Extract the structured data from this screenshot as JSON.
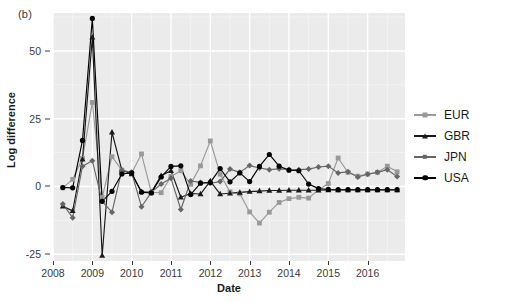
{
  "figure": {
    "panel_tag": "(b)",
    "xlabel": "Date",
    "ylabel": "Log difference"
  },
  "colors": {
    "panel_background": "#ebebeb",
    "grid_major": "#ffffff",
    "grid_minor": "#f5f5f5",
    "EUR": "#999999",
    "GBR": "#1a1a1a",
    "JPN": "#666666",
    "USA": "#000000",
    "axis_text": "#3a3a3a"
  },
  "legend": {
    "items": [
      {
        "label": "EUR",
        "symbol": "square",
        "color": "#999999"
      },
      {
        "label": "GBR",
        "symbol": "triangle",
        "color": "#1a1a1a"
      },
      {
        "label": "JPN",
        "symbol": "diamond",
        "color": "#666666"
      },
      {
        "label": "USA",
        "symbol": "circle",
        "color": "#000000"
      }
    ]
  },
  "chart_data": {
    "type": "line",
    "title": "",
    "subtitle": "",
    "xlabel": "Date",
    "ylabel": "Log difference",
    "xlim": [
      2008.0,
      2016.95
    ],
    "ylim": [
      -27.5,
      64.0
    ],
    "grid": true,
    "legend_position": "right",
    "xticks": [
      2008,
      2009,
      2010,
      2011,
      2012,
      2013,
      2014,
      2015,
      2016
    ],
    "xticklabels": [
      "2008",
      "2009",
      "2010",
      "2011",
      "2012",
      "2013",
      "2014",
      "2015",
      "2016"
    ],
    "yticks": [
      -25,
      0,
      25,
      50
    ],
    "yticklabels": [
      "-25",
      "0",
      "25",
      "50"
    ],
    "x": [
      2008.25,
      2008.5,
      2008.75,
      2009.0,
      2009.25,
      2009.5,
      2009.75,
      2010.0,
      2010.25,
      2010.5,
      2010.75,
      2011.0,
      2011.25,
      2011.5,
      2011.75,
      2012.0,
      2012.25,
      2012.5,
      2012.75,
      2013.0,
      2013.25,
      2013.5,
      2013.75,
      2014.0,
      2014.25,
      2014.5,
      2014.75,
      2015.0,
      2015.25,
      2015.5,
      2015.75,
      2016.0,
      2016.25,
      2016.5,
      2016.75
    ],
    "series": [
      {
        "name": "EUR",
        "color": "#999999",
        "symbol": "square",
        "values": [
          -0.5,
          2.6,
          10.4,
          31.0,
          -4.0,
          11.0,
          6.0,
          5.0,
          12.0,
          -2.2,
          -2.3,
          3.7,
          5.8,
          0.8,
          7.6,
          16.8,
          4.5,
          -2.0,
          -2.7,
          -9.4,
          -13.5,
          -9.5,
          -5.9,
          -4.5,
          -4.0,
          -4.3,
          -1.2,
          1.1,
          10.5,
          5.2,
          3.8,
          4.6,
          5.2,
          7.5,
          5.4
        ]
      },
      {
        "name": "GBR",
        "color": "#1a1a1a",
        "symbol": "triangle",
        "values": [
          -7.3,
          -9.0,
          10.0,
          55.0,
          -25.5,
          20.0,
          6.0,
          4.6,
          -2.0,
          -2.1,
          4.0,
          5.8,
          -4.0,
          -2.6,
          -2.8,
          2.0,
          -2.8,
          -2.5,
          -2.2,
          -1.9,
          -1.7,
          -1.5,
          -1.5,
          -1.4,
          -1.4,
          -1.4,
          -1.4,
          -1.3,
          -1.3,
          -1.3,
          -1.3,
          -1.3,
          -1.3,
          -1.3,
          -1.3
        ]
      },
      {
        "name": "JPN",
        "color": "#666666",
        "symbol": "diamond",
        "values": [
          -6.5,
          -11.5,
          7.5,
          9.5,
          -5.5,
          -9.5,
          6.0,
          5.2,
          -7.5,
          -2.2,
          0.9,
          3.0,
          -8.5,
          2.0,
          1.5,
          1.2,
          1.8,
          6.4,
          5.2,
          7.7,
          6.8,
          6.2,
          6.5,
          6.3,
          6.2,
          6.4,
          7.2,
          7.5,
          5.0,
          5.4,
          3.5,
          4.5,
          5.2,
          6.2,
          3.7
        ]
      },
      {
        "name": "USA",
        "color": "#000000",
        "symbol": "circle",
        "values": [
          -0.4,
          -0.5,
          17.0,
          62.0,
          -5.5,
          -1.8,
          4.6,
          5.0,
          -2.1,
          -2.4,
          3.5,
          7.4,
          7.6,
          -3.0,
          1.2,
          1.5,
          6.6,
          1.7,
          5.0,
          1.8,
          7.4,
          11.8,
          7.5,
          6.0,
          5.8,
          0.9,
          -0.8,
          -1.1,
          -1.2,
          -1.2,
          -1.2,
          -1.2,
          -1.2,
          -1.2,
          -1.2
        ]
      }
    ]
  }
}
